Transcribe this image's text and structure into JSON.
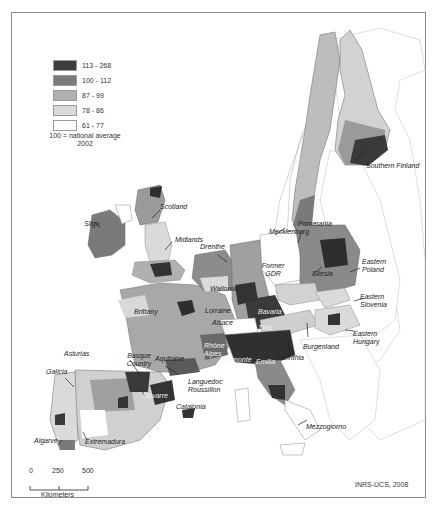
{
  "map": {
    "credit": "INRS-UCS, 2008",
    "legend": {
      "classes": [
        {
          "label": "113 - 268",
          "color": "#3c3c3c"
        },
        {
          "label": "100 - 112",
          "color": "#7a7a7a"
        },
        {
          "label": "87 - 99",
          "color": "#b0b0b0"
        },
        {
          "label": "78 - 86",
          "color": "#dadada"
        },
        {
          "label": "61 - 77",
          "color": "#ffffff"
        }
      ],
      "note_line1": "100 = national average",
      "note_line2": "2002"
    },
    "scale_bar": {
      "ticks": [
        "0",
        "250",
        "500"
      ],
      "unit": "Kilometers"
    },
    "region_labels": [
      {
        "id": "southern-finland",
        "text": "Southern Finland"
      },
      {
        "id": "scotland",
        "text": "Scotland"
      },
      {
        "id": "sligo",
        "text": "Sligo"
      },
      {
        "id": "midlands",
        "text": "Midlands"
      },
      {
        "id": "drenthe",
        "text": "Drenthe"
      },
      {
        "id": "mecklenburg",
        "text": "Mecklenburg"
      },
      {
        "id": "pomerania",
        "text": "Pomerania"
      },
      {
        "id": "former-gdr",
        "text": "Former GDR"
      },
      {
        "id": "eastern-poland",
        "text": "Eastern Poland"
      },
      {
        "id": "silesia",
        "text": "Silesia"
      },
      {
        "id": "wallonia",
        "text": "Wallonia"
      },
      {
        "id": "brittany",
        "text": "Brittany"
      },
      {
        "id": "lorraine",
        "text": "Lorraine"
      },
      {
        "id": "alsace",
        "text": "Alsace"
      },
      {
        "id": "bavaria",
        "text": "Bavaria"
      },
      {
        "id": "tirol",
        "text": "Tirol"
      },
      {
        "id": "eastern-slovenia",
        "text": "Eastern Slovenia"
      },
      {
        "id": "burgenland",
        "text": "Burgenland"
      },
      {
        "id": "eastern-hungary",
        "text": "Eastern Hungary"
      },
      {
        "id": "carinthia",
        "text": "Carinthia"
      },
      {
        "id": "rhone-alpes",
        "text": "Rhône Alpes"
      },
      {
        "id": "piemonte",
        "text": "Piemonte"
      },
      {
        "id": "emilia",
        "text": "Emilia"
      },
      {
        "id": "asturias",
        "text": "Asturias"
      },
      {
        "id": "basque-country",
        "text": "Basque Country"
      },
      {
        "id": "aquitaine",
        "text": "Aquitaine"
      },
      {
        "id": "galicia",
        "text": "Galicia"
      },
      {
        "id": "navarre",
        "text": "Navarre"
      },
      {
        "id": "languedoc-roussillon",
        "text": "Languedoc Roussillon"
      },
      {
        "id": "catalonia",
        "text": "Catalonia"
      },
      {
        "id": "mezzogiorno",
        "text": "Mezzogiorno"
      },
      {
        "id": "algarve",
        "text": "Algarve"
      },
      {
        "id": "extremadura",
        "text": "Extremadura"
      }
    ]
  }
}
